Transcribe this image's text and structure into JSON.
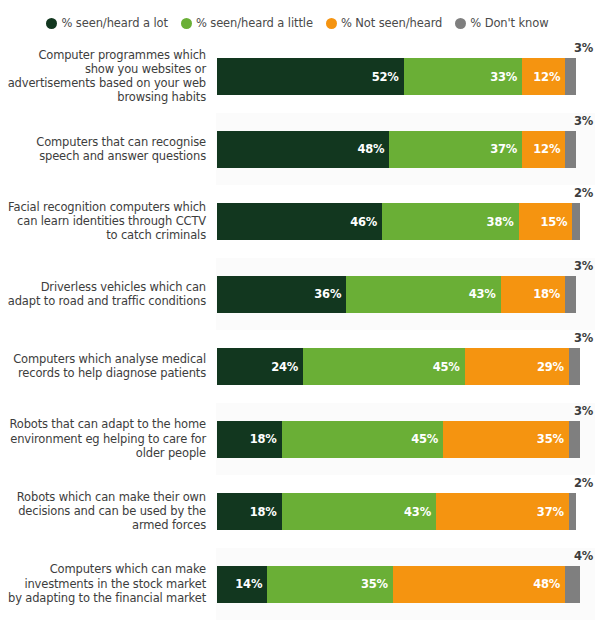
{
  "legend": {
    "items": [
      {
        "label": "% seen/heard a lot",
        "color": "#12371f",
        "icon": "legend-dot-icon"
      },
      {
        "label": "% seen/heard a little",
        "color": "#6aaf36",
        "icon": "legend-dot-icon"
      },
      {
        "label": "% Not seen/heard",
        "color": "#f59410",
        "icon": "legend-dot-icon"
      },
      {
        "label": "% Don't know",
        "color": "#7f7f7f",
        "icon": "legend-dot-icon"
      }
    ]
  },
  "chart_data": {
    "type": "bar",
    "subtype": "stacked-horizontal-100",
    "title": "",
    "xlabel": "",
    "ylabel": "",
    "xlim": [
      0,
      100
    ],
    "grid": false,
    "legend_position": "top-center",
    "value_suffix": "%",
    "colors": {
      "seen_heard_a_lot": "#12371f",
      "seen_heard_a_little": "#6aaf36",
      "not_seen_heard": "#f59410",
      "dont_know": "#7f7f7f"
    },
    "series": [
      {
        "name": "% seen/heard a lot",
        "values": [
          52,
          48,
          46,
          36,
          24,
          18,
          18,
          14
        ]
      },
      {
        "name": "% seen/heard a little",
        "values": [
          33,
          37,
          38,
          43,
          45,
          45,
          43,
          35
        ]
      },
      {
        "name": "% Not seen/heard",
        "values": [
          12,
          12,
          15,
          18,
          29,
          35,
          37,
          48
        ]
      },
      {
        "name": "% Don't know",
        "values": [
          3,
          3,
          2,
          3,
          3,
          3,
          2,
          4
        ]
      }
    ],
    "categories": [
      "Computer programmes which show you websites or advertisements based on your web browsing habits",
      "Computers that can recognise speech and answer questions",
      "Facial recognition computers which can learn identities through CCTV to catch criminals",
      "Driverless vehicles which can adapt to road and traffic conditions",
      "Computers which analyse medical records to help diagnose patients",
      "Robots that can adapt to the home environment eg helping to care for older people",
      "Robots which can make their own decisions and can be used by the armed forces",
      "Computers which can make investments in the stock market by adapting to the financial market"
    ]
  },
  "rows": [
    {
      "label_lines": [
        "Computer programmes which",
        "show you websites or",
        "advertisements based on your web",
        "browsing habits"
      ],
      "segments": [
        {
          "key": "a_lot",
          "value": 52,
          "text": "52%"
        },
        {
          "key": "a_little",
          "value": 33,
          "text": "33%"
        },
        {
          "key": "not_seen",
          "value": 12,
          "text": "12%"
        },
        {
          "key": "dont_know",
          "value": 3,
          "text": "3%"
        }
      ],
      "dk_text": "3%"
    },
    {
      "label_lines": [
        "Computers that can recognise",
        "speech and answer questions"
      ],
      "segments": [
        {
          "key": "a_lot",
          "value": 48,
          "text": "48%"
        },
        {
          "key": "a_little",
          "value": 37,
          "text": "37%"
        },
        {
          "key": "not_seen",
          "value": 12,
          "text": "12%"
        },
        {
          "key": "dont_know",
          "value": 3,
          "text": "3%"
        }
      ],
      "dk_text": "3%"
    },
    {
      "label_lines": [
        "Facial recognition computers which",
        "can learn identities through CCTV",
        "to catch criminals"
      ],
      "segments": [
        {
          "key": "a_lot",
          "value": 46,
          "text": "46%"
        },
        {
          "key": "a_little",
          "value": 38,
          "text": "38%"
        },
        {
          "key": "not_seen",
          "value": 15,
          "text": "15%"
        },
        {
          "key": "dont_know",
          "value": 2,
          "text": "2%"
        }
      ],
      "dk_text": "2%"
    },
    {
      "label_lines": [
        "Driverless vehicles which can",
        "adapt to road and traffic conditions"
      ],
      "segments": [
        {
          "key": "a_lot",
          "value": 36,
          "text": "36%"
        },
        {
          "key": "a_little",
          "value": 43,
          "text": "43%"
        },
        {
          "key": "not_seen",
          "value": 18,
          "text": "18%"
        },
        {
          "key": "dont_know",
          "value": 3,
          "text": "3%"
        }
      ],
      "dk_text": "3%"
    },
    {
      "label_lines": [
        "Computers which analyse medical",
        "records to help diagnose patients"
      ],
      "segments": [
        {
          "key": "a_lot",
          "value": 24,
          "text": "24%"
        },
        {
          "key": "a_little",
          "value": 45,
          "text": "45%"
        },
        {
          "key": "not_seen",
          "value": 29,
          "text": "29%"
        },
        {
          "key": "dont_know",
          "value": 3,
          "text": "3%"
        }
      ],
      "dk_text": "3%"
    },
    {
      "label_lines": [
        "Robots that can adapt to the home",
        "environment eg helping to care for",
        "older people"
      ],
      "segments": [
        {
          "key": "a_lot",
          "value": 18,
          "text": "18%"
        },
        {
          "key": "a_little",
          "value": 45,
          "text": "45%"
        },
        {
          "key": "not_seen",
          "value": 35,
          "text": "35%"
        },
        {
          "key": "dont_know",
          "value": 3,
          "text": "3%"
        }
      ],
      "dk_text": "3%"
    },
    {
      "label_lines": [
        "Robots which can make their own",
        "decisions and can be used by the",
        "armed forces"
      ],
      "segments": [
        {
          "key": "a_lot",
          "value": 18,
          "text": "18%"
        },
        {
          "key": "a_little",
          "value": 43,
          "text": "43%"
        },
        {
          "key": "not_seen",
          "value": 37,
          "text": "37%"
        },
        {
          "key": "dont_know",
          "value": 2,
          "text": "2%"
        }
      ],
      "dk_text": "2%"
    },
    {
      "label_lines": [
        "Computers which can make",
        "investments in the stock market",
        "by adapting to the financial market"
      ],
      "segments": [
        {
          "key": "a_lot",
          "value": 14,
          "text": "14%"
        },
        {
          "key": "a_little",
          "value": 35,
          "text": "35%"
        },
        {
          "key": "not_seen",
          "value": 48,
          "text": "48%"
        },
        {
          "key": "dont_know",
          "value": 4,
          "text": "4%"
        }
      ],
      "dk_text": "4%"
    }
  ]
}
